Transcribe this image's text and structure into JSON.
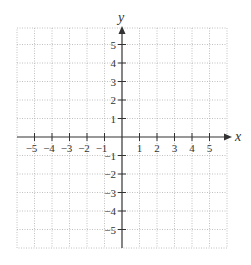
{
  "chart_data": {
    "type": "scatter",
    "title": "",
    "xlabel": "x",
    "ylabel": "y",
    "xlim": [
      -6,
      6
    ],
    "ylim": [
      -6,
      6
    ],
    "grid": true,
    "grid_style": "dotted",
    "x_ticks": [
      -5,
      -4,
      -3,
      -2,
      -1,
      1,
      2,
      3,
      4,
      5
    ],
    "y_ticks": [
      5,
      4,
      3,
      2,
      1,
      -1,
      -2,
      -3,
      -4,
      -5
    ],
    "x_tick_labels": [
      "−5",
      "−4",
      "−3",
      "−2",
      "−1",
      "1",
      "2",
      "3",
      "4",
      "5"
    ],
    "y_tick_labels": [
      "5",
      "4",
      "3",
      "2",
      "1",
      "−1",
      "−2",
      "−3",
      "−4",
      "−5"
    ],
    "series": []
  },
  "axes": {
    "x_label": "x",
    "y_label": "y"
  },
  "colors": {
    "axis": "#333333",
    "grid": "#b0b0b0",
    "background": "#ffffff"
  }
}
